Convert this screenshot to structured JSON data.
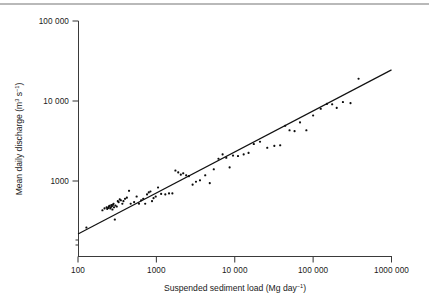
{
  "figure": {
    "background": "#ffffff",
    "ink_color": "#1a1a1a",
    "point_color": "#0d0d0d",
    "line_color": "#111111"
  },
  "chart_data": {
    "type": "scatter",
    "title": "",
    "xlabel": "Suspended sediment load (Mg day",
    "xlabel_sup": "−1",
    "xlabel_tail": ")",
    "ylabel": "Mean daily discharge (m",
    "ylabel_sup1": "3",
    "ylabel_mid": " s",
    "ylabel_sup2": "−1",
    "ylabel_tail": ")",
    "xscale": "log",
    "yscale": "log",
    "xlim": [
      100,
      1000000
    ],
    "ylim": [
      200,
      100000
    ],
    "grid": false,
    "legend": "none",
    "xticks": [
      100,
      1000,
      10000,
      100000,
      1000000
    ],
    "xticklabels": [
      "100",
      "1000",
      "10 000",
      "100 000",
      "1000 000"
    ],
    "yticks": [
      1000,
      10000,
      100000
    ],
    "yticklabels": [
      "1000",
      "10 000",
      "100 000"
    ],
    "fit": {
      "kind": "power-law regression line",
      "x_start": 100,
      "y_start": 218,
      "x_end": 1000000,
      "y_end": 24500
    },
    "x": [
      128,
      205,
      218,
      232,
      236,
      243,
      248,
      252,
      258,
      262,
      266,
      271,
      275,
      280,
      284,
      288,
      295,
      300,
      312,
      322,
      330,
      341,
      352,
      368,
      380,
      398,
      420,
      448,
      470,
      520,
      560,
      600,
      640,
      680,
      720,
      760,
      800,
      840,
      880,
      920,
      980,
      1050,
      1150,
      1300,
      1450,
      1600,
      1750,
      1900,
      2050,
      2200,
      2400,
      2600,
      2900,
      3200,
      3600,
      4200,
      4800,
      5400,
      6200,
      7000,
      7800,
      8600,
      9500,
      11000,
      13000,
      15000,
      17500,
      21000,
      26000,
      32000,
      38000,
      44000,
      50000,
      58000,
      68000,
      82000,
      100000,
      125000,
      150000,
      175000,
      200000,
      240000,
      300000,
      380000
    ],
    "y": [
      262,
      430,
      455,
      470,
      448,
      462,
      478,
      490,
      455,
      470,
      500,
      485,
      440,
      505,
      520,
      470,
      330,
      495,
      480,
      560,
      545,
      590,
      575,
      520,
      560,
      600,
      620,
      755,
      520,
      545,
      640,
      520,
      575,
      600,
      520,
      680,
      720,
      740,
      560,
      610,
      640,
      830,
      690,
      680,
      700,
      700,
      1350,
      1280,
      1200,
      1250,
      1180,
      1150,
      900,
      980,
      1020,
      1180,
      940,
      1400,
      1900,
      2150,
      1950,
      1480,
      2080,
      2050,
      2150,
      2250,
      2900,
      3100,
      2600,
      2750,
      2800,
      4900,
      4300,
      4200,
      5400,
      4300,
      6600,
      8000,
      9200,
      9100,
      8200,
      9700,
      9400,
      19000,
      9500
    ]
  }
}
